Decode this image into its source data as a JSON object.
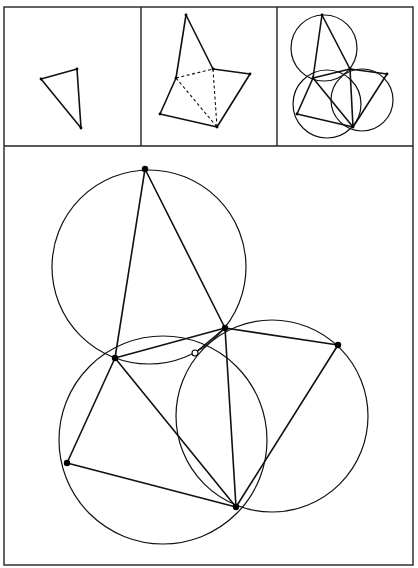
{
  "figure": {
    "colors": {
      "line": "#111111",
      "background": "#ffffff",
      "frame": "#222222"
    },
    "frame": {
      "outer": [
        4,
        7,
        413,
        565
      ],
      "row_divider_y": 146,
      "col_dividers_x": [
        141,
        277
      ]
    },
    "panels": [
      {
        "id": "step-1",
        "label": "original triangle",
        "points": {
          "A": [
            41,
            79
          ],
          "B": [
            77,
            69
          ],
          "C": [
            81,
            128
          ]
        },
        "segments": [
          [
            "A",
            "B"
          ],
          [
            "B",
            "C"
          ],
          [
            "C",
            "A"
          ]
        ]
      },
      {
        "id": "step-2",
        "label": "triangles erected on the sides",
        "points": {
          "T": [
            186,
            15
          ],
          "B": [
            176,
            78
          ],
          "C": [
            213,
            69
          ],
          "D": [
            250,
            74
          ],
          "E": [
            160,
            114
          ],
          "F": [
            217,
            127
          ]
        },
        "segments": [
          [
            "T",
            "B"
          ],
          [
            "T",
            "C"
          ],
          [
            "C",
            "D"
          ],
          [
            "D",
            "F"
          ],
          [
            "B",
            "E"
          ],
          [
            "E",
            "F"
          ]
        ],
        "dashed": [
          [
            "B",
            "C"
          ],
          [
            "B",
            "F"
          ],
          [
            "C",
            "F"
          ]
        ]
      },
      {
        "id": "step-3",
        "label": "circumcircles added",
        "points": {
          "T": [
            322,
            15
          ],
          "B": [
            313,
            78
          ],
          "C": [
            350,
            69
          ],
          "D": [
            387,
            74
          ],
          "E": [
            297,
            114
          ],
          "F": [
            353,
            127
          ]
        },
        "segments": [
          [
            "T",
            "B"
          ],
          [
            "T",
            "C"
          ],
          [
            "C",
            "D"
          ],
          [
            "D",
            "F"
          ],
          [
            "B",
            "E"
          ],
          [
            "E",
            "F"
          ],
          [
            "B",
            "C"
          ],
          [
            "B",
            "F"
          ],
          [
            "C",
            "F"
          ]
        ],
        "circles": [
          {
            "cx": 324,
            "cy": 48,
            "r": 33
          },
          {
            "cx": 327,
            "cy": 104,
            "r": 34
          },
          {
            "cx": 362,
            "cy": 100,
            "r": 31
          }
        ]
      }
    ],
    "main": {
      "id": "main-construction",
      "points": {
        "A": [
          145,
          169
        ],
        "B": [
          115,
          358
        ],
        "C": [
          225,
          328
        ],
        "D": [
          338,
          345
        ],
        "E": [
          67,
          463
        ],
        "F": [
          236,
          507
        ]
      },
      "common_point": {
        "label": "P",
        "x": 195,
        "y": 353,
        "style": "hollow"
      },
      "segments": [
        [
          "A",
          "B"
        ],
        [
          "A",
          "C"
        ],
        [
          "B",
          "C"
        ],
        [
          "C",
          "D"
        ],
        [
          "D",
          "F"
        ],
        [
          "B",
          "E"
        ],
        [
          "E",
          "F"
        ],
        [
          "B",
          "F"
        ],
        [
          "C",
          "F"
        ],
        [
          "C",
          "P"
        ]
      ],
      "circles": [
        {
          "name": "circumcircle-ABC",
          "cx": 149,
          "cy": 267,
          "r": 97
        },
        {
          "name": "circumcircle-BEF",
          "cx": 163,
          "cy": 440,
          "r": 104
        },
        {
          "name": "circumcircle-CDF",
          "cx": 272,
          "cy": 416,
          "r": 96
        }
      ]
    }
  }
}
